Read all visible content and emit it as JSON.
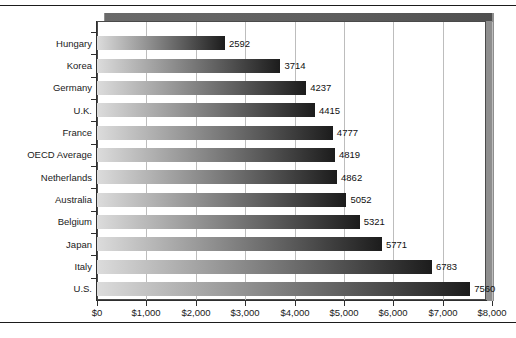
{
  "chart_data": {
    "type": "bar",
    "orientation": "horizontal",
    "title": "",
    "subtitle": "",
    "xlabel": "",
    "ylabel": "",
    "categories": [
      "Hungary",
      "Korea",
      "Germany",
      "U.K.",
      "France",
      "OECD Average",
      "Netherlands",
      "Australia",
      "Belgium",
      "Japan",
      "Italy",
      "U.S."
    ],
    "values": [
      2592,
      3714,
      4237,
      4415,
      4777,
      4819,
      4862,
      5052,
      5321,
      5771,
      6783,
      7560
    ],
    "value_labels": [
      "2592",
      "3714",
      "4237",
      "4415",
      "4777",
      "4819",
      "4862",
      "5052",
      "5321",
      "5771",
      "6783",
      "7560"
    ],
    "xlim": [
      0,
      8000
    ],
    "xticks": [
      0,
      1000,
      2000,
      3000,
      4000,
      5000,
      6000,
      7000,
      8000
    ],
    "xticklabels": [
      "$0",
      "$1,000",
      "$2,000",
      "$3,000",
      "$4,000",
      "$5,000",
      "$6,000",
      "$7,000",
      "$8,000"
    ],
    "grid": "vertical",
    "legend": "none",
    "bar_gradient_start": "#dcdcdc",
    "bar_gradient_end": "#1c1c1c",
    "gridline_color": "#bdbdbd",
    "axis_color": "#2e2e2e",
    "frame_shadow_color": "#8e8e8e",
    "background_color": "#ffffff"
  }
}
